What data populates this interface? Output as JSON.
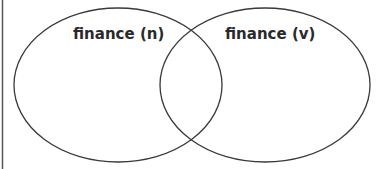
{
  "diagram": {
    "type": "venn",
    "sets": [
      {
        "label": "finance (n)",
        "cx": 118,
        "cy": 85,
        "rx": 104,
        "ry": 77
      },
      {
        "label": "finance (v)",
        "cx": 265,
        "cy": 85,
        "rx": 105,
        "ry": 77
      }
    ],
    "stroke_color": "#3a3a3a",
    "border_color": "#555555",
    "background": "#ffffff"
  }
}
